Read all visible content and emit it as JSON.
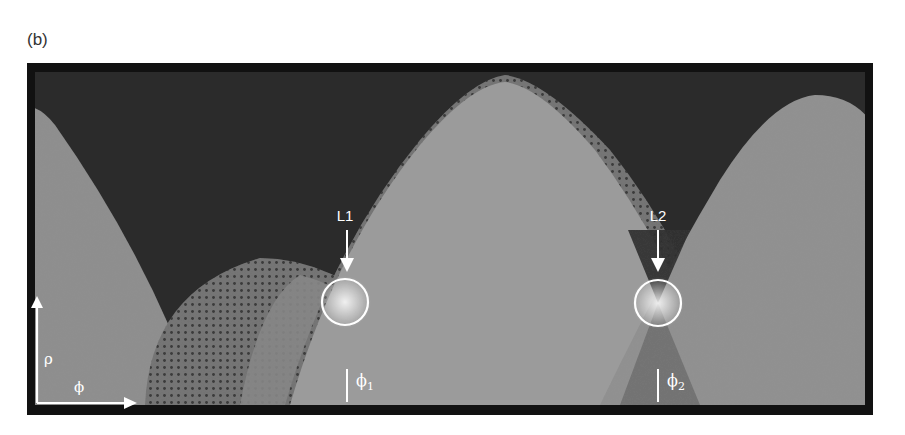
{
  "figure": {
    "panel_label": "(b)",
    "axes": {
      "y_axis_label": "ρ",
      "x_axis_label": "ϕ"
    },
    "markers": [
      {
        "id": "L1",
        "label": "L1",
        "phi_label": "ϕ",
        "phi_subscript": "1"
      },
      {
        "id": "L2",
        "label": "L2",
        "phi_label": "ϕ",
        "phi_subscript": "2"
      }
    ],
    "colors": {
      "frame": "#111111",
      "background": "#2b2b2b",
      "band_light": "#9a9a9a",
      "band_mid": "#8a8a8a",
      "band_dark": "#6e6e6e",
      "overlay": "#ffffff"
    }
  }
}
